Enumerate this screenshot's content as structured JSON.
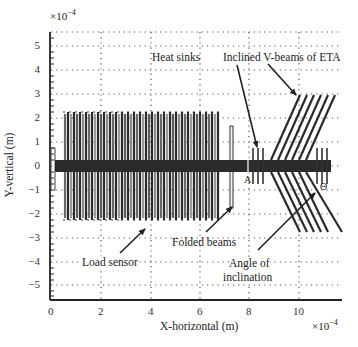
{
  "figure": {
    "x_axis": {
      "label": "X-horizontal (m)",
      "multiplier": "×10",
      "multiplier_exp": "−4",
      "ticks": [
        "0",
        "2",
        "4",
        "6",
        "8",
        "10"
      ],
      "range": [
        0,
        11.6
      ]
    },
    "y_axis": {
      "label": "Y-vertical (m)",
      "multiplier": "×10",
      "multiplier_exp": "−4",
      "ticks": [
        "5",
        "4",
        "3",
        "2",
        "1",
        "0",
        "−1",
        "−2",
        "−3",
        "−4",
        "−5"
      ],
      "range": [
        -5.6,
        5.6
      ]
    },
    "annotations": {
      "heat_sinks": "Heat sinks",
      "v_beams": "Inclined V-beams of ETA",
      "load_sensor": "Load sensor",
      "folded_beams": "Folded beams",
      "angle_line1": "Angle of",
      "angle_line2": "inclination",
      "point_a": "A",
      "theta": "Θ"
    },
    "colors": {
      "structure_dark": "#2b2b2b",
      "structure_mid": "#6a6a6a",
      "grid": "#444444"
    }
  }
}
